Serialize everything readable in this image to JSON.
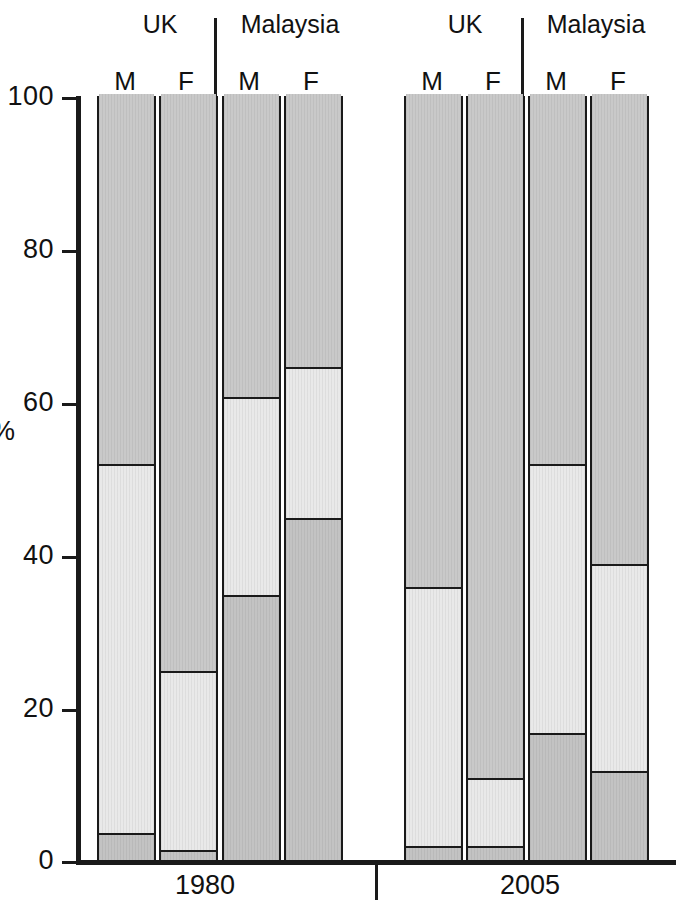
{
  "chart_data": {
    "type": "bar",
    "title": "",
    "xlabel": "",
    "ylabel": "%",
    "ylim": [
      0,
      100
    ],
    "yticks": [
      0,
      20,
      40,
      60,
      80,
      100
    ],
    "grid": false,
    "legend": "none",
    "stacked": true,
    "group_labels": [
      "1980",
      "2005"
    ],
    "country_labels": [
      "UK",
      "Malaysia"
    ],
    "sex_labels": [
      "M",
      "F"
    ],
    "categories": [
      "1980 UK M",
      "1980 UK F",
      "1980 Malaysia M",
      "1980 Malaysia F",
      "2005 UK M",
      "2005 UK F",
      "2005 Malaysia M",
      "2005 Malaysia F"
    ],
    "series": [
      {
        "name": "top-segment",
        "values": [
          48.3,
          75.3,
          39.6,
          35.6,
          64.4,
          89.3,
          48.3,
          61.4
        ]
      },
      {
        "name": "middle-segment",
        "values": [
          48.2,
          23.4,
          25.8,
          19.8,
          33.8,
          8.9,
          35.1,
          27.0
        ]
      },
      {
        "name": "bottom-segment",
        "values": [
          3.5,
          1.3,
          34.6,
          44.6,
          1.8,
          1.8,
          16.6,
          11.6
        ]
      }
    ],
    "cumulative_boundaries": [
      {
        "category": "1980 UK M",
        "lower": 3.5,
        "upper": 51.7
      },
      {
        "category": "1980 UK F",
        "lower": 1.3,
        "upper": 24.7
      },
      {
        "category": "1980 Malaysia M",
        "lower": 34.6,
        "upper": 60.4
      },
      {
        "category": "1980 Malaysia F",
        "lower": 44.6,
        "upper": 64.4
      },
      {
        "category": "2005 UK M",
        "lower": 1.8,
        "upper": 35.6
      },
      {
        "category": "2005 UK F",
        "lower": 1.8,
        "upper": 10.7
      },
      {
        "category": "2005 Malaysia M",
        "lower": 16.6,
        "upper": 51.7
      },
      {
        "category": "2005 Malaysia F",
        "lower": 11.6,
        "upper": 38.6
      }
    ],
    "colors": {
      "top": "#c9c9c9",
      "middle": "#e9e9e9",
      "bottom": "#c3c3c3",
      "outline": "#1a1a1a",
      "background": "#ffffff"
    }
  },
  "axis": {
    "y_title": "%",
    "ticks": [
      "100",
      "80",
      "60",
      "40",
      "20",
      "0"
    ]
  },
  "groups": [
    {
      "period": "1980",
      "countries": [
        {
          "name": "UK",
          "bars": [
            {
              "sex": "M"
            },
            {
              "sex": "F"
            }
          ]
        },
        {
          "name": "Malaysia",
          "bars": [
            {
              "sex": "M"
            },
            {
              "sex": "F"
            }
          ]
        }
      ]
    },
    {
      "period": "2005",
      "countries": [
        {
          "name": "UK",
          "bars": [
            {
              "sex": "M"
            },
            {
              "sex": "F"
            }
          ]
        },
        {
          "name": "Malaysia",
          "bars": [
            {
              "sex": "M"
            },
            {
              "sex": "F"
            }
          ]
        }
      ]
    }
  ]
}
